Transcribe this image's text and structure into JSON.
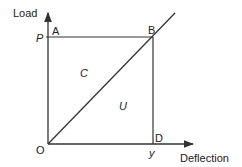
{
  "diagram": {
    "axes": {
      "y_label": "Load",
      "x_label": "Deflection"
    },
    "points": {
      "origin": "O",
      "a": "A",
      "b": "B",
      "d": "D",
      "p": "P",
      "y": "y"
    },
    "regions": {
      "upper": "C",
      "lower": "U"
    },
    "colors": {
      "line": "#333333",
      "background": "#ffffff"
    }
  }
}
